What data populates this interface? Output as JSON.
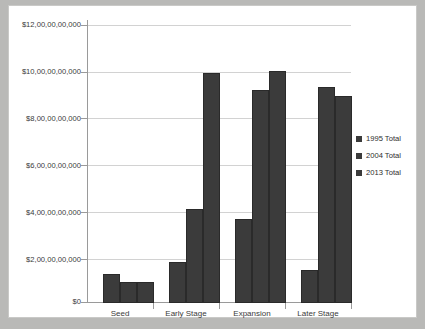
{
  "chart_data": {
    "type": "bar",
    "title": "",
    "xlabel": "",
    "ylabel": "",
    "categories": [
      "Seed",
      "Early Stage",
      "Expansion",
      "Later Stage"
    ],
    "series": [
      {
        "name": "1995 Total",
        "color": "#3b3b3b",
        "values": [
          1250000000,
          1720000000,
          3550000000,
          1420000000
        ]
      },
      {
        "name": "2004 Total",
        "color": "#3b3b3b",
        "values": [
          870000000,
          4000000000,
          9030000000,
          9170000000
        ]
      },
      {
        "name": "2013 Total",
        "color": "#3b3b3b",
        "values": [
          900000000,
          9750000000,
          9830000000,
          8780000000
        ]
      }
    ],
    "ylim": [
      0,
      12000000000
    ],
    "ytick_values": [
      0,
      2000000000,
      4000000000,
      6000000000,
      8000000000,
      10000000000,
      12000000000
    ],
    "ytick_labels": [
      "$0",
      "$2,00,00,00,000",
      "$4,00,00,00,000",
      "$6,00,00,00,000",
      "$8,00,00,00,000",
      "$10,00,00,00,000",
      "$12,00,00,00,000"
    ],
    "grid": true,
    "legend_position": "right",
    "legend_entries": [
      "1995 Total",
      "2004 Total",
      "2013 Total"
    ]
  },
  "colors": {
    "bar": "#3b3b3b",
    "gridline": "#d2d2d2",
    "axis": "#9a9a9a",
    "plot_background": "#ffffff",
    "page_background": "#b9b9b7"
  }
}
